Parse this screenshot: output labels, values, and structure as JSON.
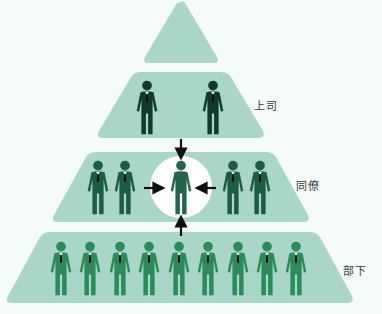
{
  "colors": {
    "background": "#f4fbf9",
    "tier_fill": "#a9d6c6",
    "highlight_circle": "#ffffff",
    "boss_figure": "#12392b",
    "peer_figure": "#1d5c43",
    "self_figure": "#25664b",
    "subordinate_figure": "#2c8a5c",
    "arrow": "#111111"
  },
  "tiers": [
    {
      "id": "top",
      "label": "",
      "figures": 0
    },
    {
      "id": "boss",
      "label": "上司",
      "figures": 2
    },
    {
      "id": "peers",
      "label": "同僚",
      "figures": 5
    },
    {
      "id": "subordinates",
      "label": "部下",
      "figures": 9
    }
  ],
  "labels": {
    "boss": "上司",
    "peers": "同僚",
    "subordinates": "部下"
  },
  "center": {
    "description": "self at center receiving input from all directions",
    "arrows": [
      "down-from-boss",
      "right-from-peers-left",
      "left-from-peers-right",
      "up-from-subordinates"
    ]
  }
}
